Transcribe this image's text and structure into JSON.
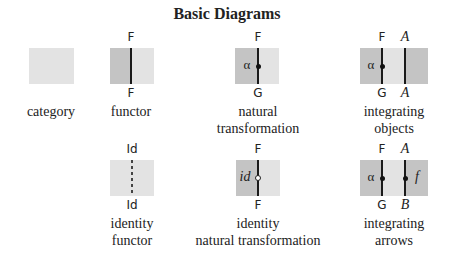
{
  "title": "Basic Diagrams",
  "colors": {
    "light_region": "#e3e3e3",
    "dark_region": "#c4c4c4",
    "wire": "#1a1a1a"
  },
  "diagrams": {
    "category": {
      "caption": [
        "category"
      ]
    },
    "functor": {
      "top": "F",
      "bottom": "F",
      "caption": [
        "functor"
      ]
    },
    "natural_transformation": {
      "top": "F",
      "bottom": "G",
      "node": "α",
      "caption": [
        "natural",
        "transformation"
      ]
    },
    "integrating_objects": {
      "top_left": "F",
      "top_right": "A",
      "bottom_left": "G",
      "bottom_right": "A",
      "node": "α",
      "caption": [
        "integrating",
        "objects"
      ]
    },
    "identity_functor": {
      "top": "Id",
      "bottom": "Id",
      "caption": [
        "identity",
        "functor"
      ]
    },
    "identity_natural_transformation": {
      "top": "F",
      "bottom": "F",
      "node": "id",
      "caption": [
        "identity",
        "natural transformation"
      ]
    },
    "integrating_arrows": {
      "top_left": "F",
      "top_right": "A",
      "bottom_left": "G",
      "bottom_right": "B",
      "node_left": "α",
      "node_right": "f",
      "caption": [
        "integrating",
        "arrows"
      ]
    }
  }
}
